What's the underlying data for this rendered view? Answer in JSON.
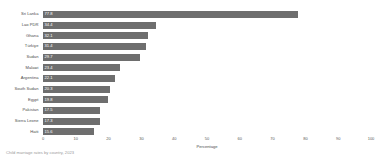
{
  "chart_data": {
    "type": "bar",
    "orientation": "horizontal",
    "title": "",
    "subtitle": "",
    "xlabel": "Percentage",
    "ylabel": "",
    "xlim": [
      0,
      100
    ],
    "grid": false,
    "legend": null,
    "bar_color": "#6e6e6e",
    "categories": [
      "Sri Lanka",
      "Lao PDR",
      "Ghana",
      "Türkiye",
      "Sudan",
      "Malawi",
      "Argentina",
      "South Sudan",
      "Egypt",
      "Pakistan",
      "Sierra Leone",
      "Haiti"
    ],
    "values": [
      77.8,
      34.4,
      32.1,
      31.4,
      29.7,
      23.4,
      22.1,
      20.3,
      19.8,
      17.5,
      17.3,
      15.6
    ],
    "value_labels": [
      "77.8",
      "34.4",
      "32.1",
      "31.4",
      "29.7",
      "23.4",
      "22.1",
      "20.3",
      "19.8",
      "17.5",
      "17.3",
      "15.6"
    ],
    "xticks": [
      0,
      10,
      20,
      30,
      40,
      50,
      60,
      70,
      80,
      90,
      100
    ],
    "xtick_labels": [
      "0",
      "10",
      "20",
      "30",
      "40",
      "50",
      "60",
      "70",
      "80",
      "90",
      "100"
    ]
  },
  "footnote": {
    "text": "Child marriage rates by country, 2023"
  }
}
